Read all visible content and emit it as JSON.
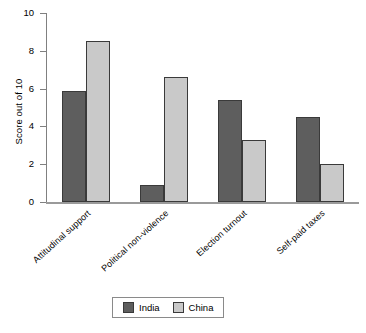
{
  "chart_data": {
    "type": "bar",
    "title": "",
    "xlabel": "",
    "ylabel": "Score out of 10",
    "ylim": [
      0,
      10
    ],
    "yticks": [
      0,
      2,
      4,
      6,
      8,
      10
    ],
    "ytick_labels": [
      "0",
      "2",
      "4",
      "6",
      "8",
      "10"
    ],
    "grid": false,
    "legend_position": "bottom-center",
    "categories": [
      "Attitudinal support",
      "Political non-violence",
      "Election turnout",
      "Self-paid taxes"
    ],
    "series": [
      {
        "name": "India",
        "color": "#5e5e5e",
        "values": [
          5.9,
          0.9,
          5.4,
          4.5
        ]
      },
      {
        "name": "China",
        "color": "#c9c9c9",
        "values": [
          8.5,
          6.6,
          3.3,
          2.0
        ]
      }
    ]
  },
  "legend": {
    "entries": [
      {
        "label": "India",
        "swatch": "india-swatch"
      },
      {
        "label": "China",
        "swatch": "china-swatch"
      }
    ]
  }
}
